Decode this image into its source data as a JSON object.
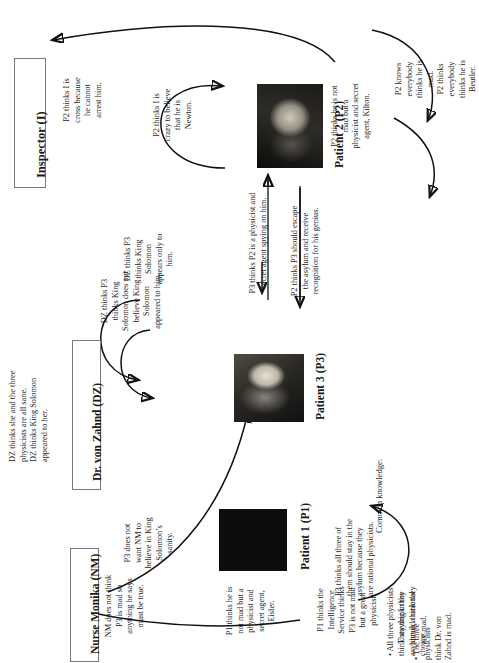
{
  "diagram": {
    "title_note": "Belief network diagram for The Physicists",
    "orientation": "rotated-90-ccw"
  },
  "nodes": {
    "inspector": {
      "label": "Inspector (I)"
    },
    "von_zahnd": {
      "label": "Dr. von Zahnd (DZ)"
    },
    "nurse_monika": {
      "label": "Nurse Monika (NM)"
    },
    "patient1": {
      "label": "Patient 1 (P1)"
    },
    "patient3": {
      "label": "Patient 3  (P3)"
    },
    "patient2": {
      "label": "Patient 2 (P2)"
    }
  },
  "annotations": {
    "dz_top": "DZ thinks she and the three\nphysicists are all sane.\nDZ thinks King Solomon\nappeared to her.",
    "dz_p3_appeared": "DZ thinks P3\nthinks King\nSolomon does not\nbelieve King\nSolomon\nappeared to him.",
    "dz_p3_only": "DZ thinks P3\nthinks King\nSolomon\nappears only to\nhim.",
    "p2_arrest": "P2 thinks I is\ncross because\nhe cannot\narrest him.",
    "p2_newton": "P2 thinks I is\ncrazy to believe\nthat he is\nNewton.",
    "p2_self": "P2 thinks he is not\nmad but a\nphysicist and secret\nagent, Kilton.",
    "p2_knows": "P2 knows\neverybody\nthinks he is\nmad.\nP2 thinks\neverybody\nthinks he is\nBeutler.",
    "p3_spy": "P3 thinks P2 is a physicist and\nsecret agent spying on him.",
    "p2_escape": "P2 thinks P3 should escape\nthe asylum and receive\nrecognition for his genius.",
    "p3_sanity": "P3 does not\nwant NM to\nbelieve in King\nSolomon’s\nsanity.",
    "nm_mad": "NM does not think\nP3 is mad so\nanything he says\nmust be true.",
    "p1_self": "P1 thinks he is\nnot mad but a\nphysicist and\nsecret agent,\nEisler.",
    "p1_service": "P1 thinks the\nIntelligence\nService thinks\nP3 is not mad\nbut a great\nphysicist.",
    "p3_rational": "P3 thinks all three of\nthem should stay in the\nasylum because they\nare rational physicists."
  },
  "common_knowledge": {
    "heading": "Common knowledge:",
    "items": [
      "• All three physicists think staying in the asylum is a rational choice:",
      "They think they should think they are mad.",
      "• The three physicists think Dr. von Zahnd is mad."
    ]
  },
  "colors": {
    "ink": "#1a1a1a",
    "stroke": "#111111",
    "box_border": "#7a7a7a",
    "background": "#ffffff"
  }
}
